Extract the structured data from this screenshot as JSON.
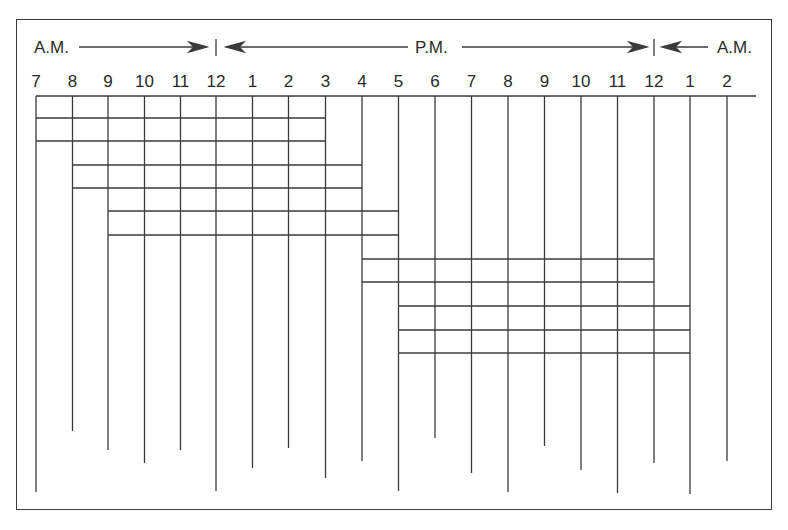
{
  "diagram": {
    "period_labels": {
      "am_start": "A.M.",
      "pm": "P.M.",
      "am_end": "A.M."
    },
    "hours": [
      "7",
      "8",
      "9",
      "10",
      "11",
      "12",
      "1",
      "2",
      "3",
      "4",
      "5",
      "6",
      "7",
      "8",
      "9",
      "10",
      "11",
      "12",
      "1",
      "2"
    ],
    "hour_x": [
      36,
      72.5,
      108,
      144.5,
      180.5,
      216,
      252.5,
      288.5,
      325.5,
      362,
      398.5,
      435,
      471.5,
      508,
      544.5,
      581,
      617.5,
      654,
      690,
      727
    ],
    "vertical_line_bottoms": [
      492,
      431,
      450,
      463,
      450,
      491,
      468,
      448,
      478,
      461,
      491,
      438,
      473,
      492,
      446,
      470,
      493,
      463,
      494,
      461
    ],
    "shifts": [
      {
        "name": "Shift 7 A.M. - 3 P.M.",
        "start_index": 0,
        "end_index": 8,
        "rows_y": [
          118,
          141
        ]
      },
      {
        "name": "Shift 8 A.M. - 4 P.M.",
        "start_index": 1,
        "end_index": 9,
        "rows_y": [
          165,
          188
        ]
      },
      {
        "name": "Shift 9 A.M. - 5 P.M.",
        "start_index": 2,
        "end_index": 10,
        "rows_y": [
          211,
          235
        ]
      },
      {
        "name": "Shift 4 P.M. - 12 A.M.",
        "start_index": 9,
        "end_index": 17,
        "rows_y": [
          259,
          282
        ]
      },
      {
        "name": "Shift 5 P.M. - 1 A.M.",
        "start_index": 10,
        "end_index": 18,
        "rows_y": [
          306,
          330,
          353
        ]
      }
    ],
    "colors": {
      "line": "#3a3a3a",
      "text": "#2a2a2a",
      "background": "#ffffff"
    }
  }
}
